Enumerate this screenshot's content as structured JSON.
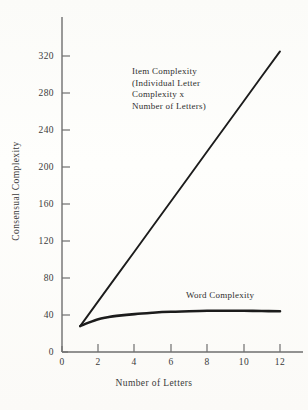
{
  "chart_data": {
    "type": "line",
    "title": "",
    "xlabel": "Number of Letters",
    "ylabel": "Consensual Complexity",
    "xlim": [
      0,
      13
    ],
    "ylim": [
      0,
      340
    ],
    "xticks": [
      "0",
      "2",
      "4",
      "6",
      "8",
      "10",
      "12"
    ],
    "xtick_values": [
      0,
      2,
      4,
      6,
      8,
      10,
      12
    ],
    "yticks": [
      "0",
      "40",
      "80",
      "120",
      "160",
      "200",
      "240",
      "280",
      "320"
    ],
    "ytick_values": [
      0,
      40,
      80,
      120,
      160,
      200,
      240,
      280,
      320
    ],
    "grid": false,
    "legend": "none",
    "annotations": [
      {
        "name": "item-complexity",
        "lines": [
          "Item Complexity",
          "(Individual Letter",
          "Complexity x",
          "Number of Letters)"
        ]
      },
      {
        "name": "word-complexity",
        "lines": [
          "Word Complexity"
        ]
      }
    ],
    "series": [
      {
        "name": "Item Complexity (Individual Letter Complexity x Number of Letters)",
        "x": [
          1,
          2,
          3,
          4,
          5,
          6,
          7,
          8,
          9,
          10,
          11,
          12
        ],
        "values": [
          28,
          55,
          82,
          109,
          136,
          163,
          190,
          217,
          244,
          271,
          298,
          325
        ]
      },
      {
        "name": "Word Complexity",
        "x": [
          1,
          1.5,
          2,
          2.5,
          3,
          4,
          5,
          6,
          7,
          8,
          9,
          10,
          11,
          12
        ],
        "values": [
          28,
          32,
          35.5,
          37.5,
          39,
          41,
          42.5,
          43.5,
          44,
          44.5,
          44.5,
          44.5,
          44.3,
          44
        ],
        "color": "#1c1c1c"
      }
    ]
  },
  "figure": {
    "background_color": "#fdfdfb",
    "axis_color": "#6f6f6f",
    "line_color": "#1c1c1c"
  }
}
